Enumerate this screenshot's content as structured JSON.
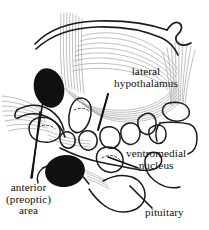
{
  "figure": {
    "background_color": "#ffffff",
    "ink_color": "#111111",
    "fiber_color": "#9a9a9a",
    "width": 209,
    "height": 230
  },
  "labels": {
    "lateral_hypothalamus": {
      "line1": "lateral",
      "line2": "hypothalamus"
    },
    "ventromedial_nucleus": {
      "line1": "ventromedial",
      "line2": "nucleus"
    },
    "anterior_preoptic_area": {
      "line1": "anterior",
      "line2": "(preoptic)",
      "line3": "area"
    },
    "pituitary": {
      "line1": "pituitary"
    }
  },
  "structures": [
    {
      "name": "fornix",
      "kind": "arched-fiber-bundle"
    },
    {
      "name": "paraventricular-nucleus",
      "kind": "solid-black-oval"
    },
    {
      "name": "optic-chiasm",
      "kind": "solid-black-oval"
    },
    {
      "name": "mammillary-body",
      "kind": "outlined-oval"
    },
    {
      "name": "ventromedial-nucleus",
      "kind": "outlined-round-nucleus"
    },
    {
      "name": "lateral-hypothalamic-area",
      "kind": "fiber-field"
    },
    {
      "name": "pituitary-stalk",
      "kind": "outlined-curve"
    },
    {
      "name": "pituitary-gland",
      "kind": "outlined-lobe"
    }
  ]
}
